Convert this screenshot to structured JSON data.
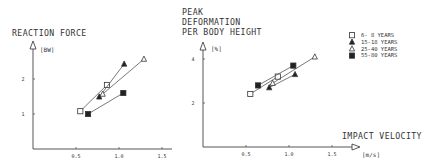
{
  "chart_data": [
    {
      "type": "line",
      "title": "REACTION FORCE",
      "ylabel": "REACTION FORCE",
      "yunit": "[BW]",
      "xlabel": "",
      "xunit": "",
      "xlim": [
        0,
        1.7
      ],
      "ylim": [
        0,
        2.9
      ],
      "xticks": [
        0.5,
        1.0,
        1.5
      ],
      "xtick_labels": [
        "0.5",
        "1.0",
        "1.5"
      ],
      "yticks": [
        1,
        2
      ],
      "ytick_labels": [
        "1",
        "2"
      ],
      "grid": false,
      "series": [
        {
          "name": "6- 8 YEARS",
          "marker": "square-open",
          "x": [
            0.55,
            0.86
          ],
          "y": [
            1.08,
            1.83
          ]
        },
        {
          "name": "15-18 YEARS",
          "marker": "triangle-filled",
          "x": [
            0.77,
            1.06
          ],
          "y": [
            1.49,
            2.43
          ]
        },
        {
          "name": "25-40 YEARS",
          "marker": "triangle-open",
          "x": [
            0.81,
            1.29
          ],
          "y": [
            1.57,
            2.57
          ]
        },
        {
          "name": "55-80 YEARS",
          "marker": "square-filled",
          "x": [
            0.64,
            1.05
          ],
          "y": [
            1.0,
            1.6
          ]
        }
      ]
    },
    {
      "type": "line",
      "title": "PEAK DEFORMATION PER BODY HEIGHT",
      "title_lines": [
        "PEAK",
        "DEFORMATION",
        "PER BODY HEIGHT"
      ],
      "ylabel": "PEAK DEFORMATION PER BODY HEIGHT",
      "yunit": "[%]",
      "xlabel": "IMPACT VELOCITY",
      "xunit": "[m/s]",
      "xlim": [
        0,
        1.7
      ],
      "ylim": [
        0,
        4.5
      ],
      "xticks": [
        0.5,
        1.0,
        1.5
      ],
      "xtick_labels": [
        "0.5",
        "1.0",
        "1.5"
      ],
      "yticks": [
        2,
        4
      ],
      "ytick_labels": [
        "2",
        "4"
      ],
      "grid": false,
      "legend_position": "upper right",
      "series": [
        {
          "name": "6- 8 YEARS",
          "marker": "square-open",
          "x": [
            0.55,
            0.87
          ],
          "y": [
            2.41,
            3.2
          ]
        },
        {
          "name": "15-18 YEARS",
          "marker": "triangle-filled",
          "x": [
            0.77,
            1.07
          ],
          "y": [
            2.7,
            3.3
          ]
        },
        {
          "name": "25-40 YEARS",
          "marker": "triangle-open",
          "x": [
            0.81,
            1.3
          ],
          "y": [
            2.9,
            4.1
          ]
        },
        {
          "name": "55-80 YEARS",
          "marker": "square-filled",
          "x": [
            0.64,
            1.05
          ],
          "y": [
            2.8,
            3.7
          ]
        }
      ]
    }
  ],
  "legend": {
    "items": [
      {
        "label": "6- 8 YEARS",
        "marker": "square-open"
      },
      {
        "label": "15-18 YEARS",
        "marker": "triangle-filled"
      },
      {
        "label": "25-40 YEARS",
        "marker": "triangle-open"
      },
      {
        "label": "55-80 YEARS",
        "marker": "square-filled"
      }
    ]
  },
  "labels": {
    "left_title": "REACTION FORCE",
    "left_unit": "[BW]",
    "right_title_1": "PEAK",
    "right_title_2": "DEFORMATION",
    "right_title_3": "PER BODY HEIGHT",
    "right_unit": "[%]",
    "x_title": "IMPACT VELOCITY",
    "x_unit": "[m/s]"
  },
  "colors": {
    "ink": "#333333",
    "background": "#ffffff"
  }
}
